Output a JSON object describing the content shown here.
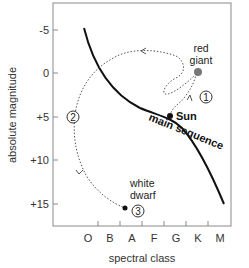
{
  "diagram": {
    "type": "hertzsprung-russell",
    "y_axis": {
      "title": "absolute magnitude",
      "ticks": [
        "-5",
        "0",
        "+5",
        "+10",
        "+15"
      ]
    },
    "x_axis": {
      "title": "spectral class",
      "ticks": [
        "O",
        "B",
        "A",
        "F",
        "G",
        "K",
        "M"
      ]
    },
    "curve_label": "main sequence",
    "points": {
      "sun": "Sun",
      "red_giant_line1": "red",
      "red_giant_line2": "giant",
      "white_dwarf_line1": "white",
      "white_dwarf_line2": "dwarf"
    },
    "stages": {
      "one": "1",
      "two": "2",
      "three": "3"
    },
    "colors": {
      "frame": "#888888",
      "curve": "#111111",
      "path": "#555555",
      "red_giant_dot": "#777777"
    }
  }
}
